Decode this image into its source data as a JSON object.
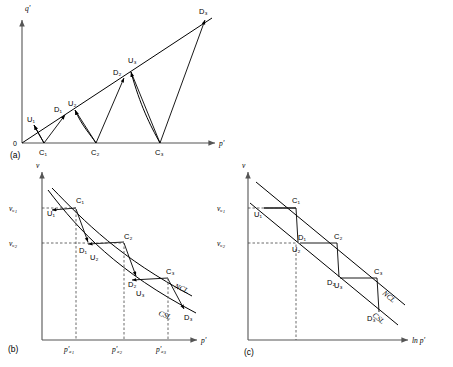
{
  "figure": {
    "panels": [
      {
        "id": "a",
        "id_label": "(a)",
        "x_axis_label": "p'",
        "y_axis_label": "q'",
        "origin_label": "0",
        "point_labels": [
          "U₁",
          "C₁",
          "D₁",
          "U₂",
          "C₂",
          "D₂",
          "U₃",
          "C₃",
          "D₃"
        ],
        "csl_points": [
          "U₁",
          "D₁",
          "U₂",
          "D₂",
          "U₃",
          "D₃"
        ],
        "base_points": [
          "C₁",
          "C₂",
          "C₃"
        ]
      },
      {
        "id": "b",
        "id_label": "(b)",
        "x_axis_label": "p'",
        "y_axis_label": "v",
        "y_ticks": [
          "vᵤ₁",
          "vᵤ₂"
        ],
        "x_ticks": [
          "p'ₐ₁",
          "p'ₐ₂",
          "p'ₐ₃"
        ],
        "curve_labels": [
          "NCL",
          "CSL"
        ],
        "point_labels": [
          "U₁",
          "C₁",
          "D₁",
          "U₂",
          "C₂",
          "D₂",
          "U₃",
          "C₃",
          "D₃"
        ]
      },
      {
        "id": "c",
        "id_label": "(c)",
        "x_axis_label": "ln p'",
        "y_axis_label": "v",
        "y_ticks": [
          "vᵤ₁",
          "vᵤ₂"
        ],
        "curve_labels": [
          "NCL",
          "CSL"
        ],
        "point_labels": [
          "U₁",
          "C₁",
          "D₁",
          "U₂",
          "C₂",
          "D₂",
          "U₃",
          "C₃",
          "D₃"
        ]
      }
    ],
    "colors": {
      "ink": "#000000",
      "axis": "#555555",
      "background": "#ffffff"
    }
  }
}
